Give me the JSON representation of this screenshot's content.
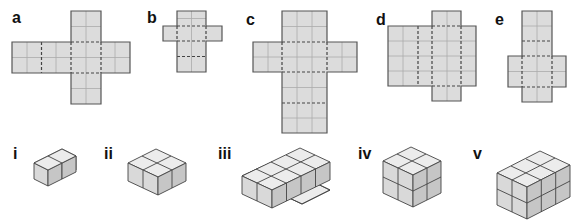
{
  "nets": {
    "title": "Nets of cuboids",
    "items": [
      {
        "label": "a",
        "description": "2x2 faces cross net: horizontal strip of 4 faces with top and bottom tabs"
      },
      {
        "label": "b",
        "description": "column of 4 faces (2 wide) with side tabs 2x2"
      },
      {
        "label": "c",
        "description": "column 3 wide with 2-wide side tabs"
      },
      {
        "label": "d",
        "description": "4x6 body with 2-wide top and bottom tabs"
      },
      {
        "label": "e",
        "description": "column 2 wide with side tabs"
      }
    ]
  },
  "solids": {
    "title": "Cuboids built from unit cubes",
    "items": [
      {
        "label": "i",
        "dims": "1 x 2 x 1",
        "cubes": 2
      },
      {
        "label": "ii",
        "dims": "2 x 2 x 1",
        "cubes": 4
      },
      {
        "label": "iii",
        "dims": "2 x 4 x 1",
        "cubes": 8
      },
      {
        "label": "iv",
        "dims": "2 x 2 x 2",
        "cubes": 8
      },
      {
        "label": "v",
        "dims": "2 x 3 x 2",
        "cubes": 12
      }
    ]
  },
  "colors": {
    "face": "#dcdcdc",
    "grid": "#a9a9a9",
    "outline": "#555555",
    "dash": "#444444",
    "cube_top": "#ececec",
    "cube_left": "#d9d9d9",
    "cube_right": "#c4c4c4"
  }
}
